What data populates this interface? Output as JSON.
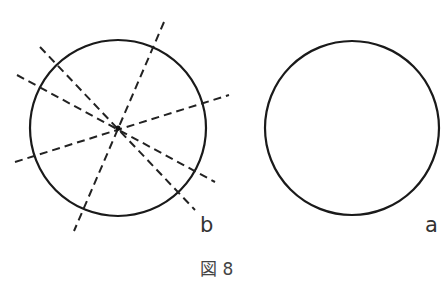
{
  "figure": {
    "caption": "図 8",
    "circle_b": {
      "label": "b",
      "cx": 118,
      "cy": 128,
      "r": 88
    },
    "circle_a": {
      "label": "a",
      "cx": 352,
      "cy": 128,
      "r": 87
    },
    "dashed_lines": [
      {
        "x1": 164,
        "y1": 22,
        "x2": 74,
        "y2": 231
      },
      {
        "x1": 40,
        "y1": 47,
        "x2": 195,
        "y2": 210
      },
      {
        "x1": 17,
        "y1": 75,
        "x2": 215,
        "y2": 182
      },
      {
        "x1": 15,
        "y1": 162,
        "x2": 229,
        "y2": 95
      }
    ],
    "center_point": {
      "x": 118,
      "y": 128
    }
  }
}
